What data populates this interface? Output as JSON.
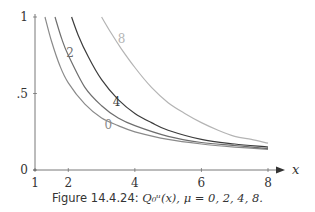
{
  "chart_data": {
    "type": "line",
    "title": "",
    "xlabel": "x",
    "ylabel": "",
    "xlim": [
      1,
      8.3
    ],
    "ylim": [
      0,
      1
    ],
    "grid": false,
    "legend": "inline curve labels",
    "x_ticks": [
      1,
      2,
      4,
      6,
      8
    ],
    "x_tick_labels": [
      "1",
      "2",
      "4",
      "6",
      "8"
    ],
    "y_ticks": [
      0,
      0.5,
      1
    ],
    "y_tick_labels": [
      "0",
      ".5",
      "1"
    ],
    "series": [
      {
        "name": "0",
        "color": "#8a8a8a",
        "label_pos": [
          3.2,
          0.27
        ],
        "points": [
          [
            1.3,
            1.0
          ],
          [
            1.5,
            0.84
          ],
          [
            1.75,
            0.68
          ],
          [
            2.0,
            0.57
          ],
          [
            2.5,
            0.43
          ],
          [
            3.0,
            0.34
          ],
          [
            3.5,
            0.29
          ],
          [
            4.0,
            0.25
          ],
          [
            5.0,
            0.2
          ],
          [
            6.0,
            0.17
          ],
          [
            7.0,
            0.15
          ],
          [
            8.0,
            0.135
          ]
        ]
      },
      {
        "name": "2",
        "color": "#6e6e6e",
        "label_pos": [
          2.05,
          0.74
        ],
        "points": [
          [
            1.6,
            1.0
          ],
          [
            1.8,
            0.86
          ],
          [
            2.0,
            0.75
          ],
          [
            2.5,
            0.54
          ],
          [
            3.0,
            0.42
          ],
          [
            3.5,
            0.34
          ],
          [
            4.0,
            0.29
          ],
          [
            5.0,
            0.22
          ],
          [
            6.0,
            0.18
          ],
          [
            7.0,
            0.16
          ],
          [
            8.0,
            0.14
          ]
        ]
      },
      {
        "name": "4",
        "color": "#3c3c3c",
        "label_pos": [
          3.45,
          0.42
        ],
        "points": [
          [
            2.1,
            1.0
          ],
          [
            2.3,
            0.88
          ],
          [
            2.6,
            0.74
          ],
          [
            3.0,
            0.59
          ],
          [
            3.5,
            0.46
          ],
          [
            4.0,
            0.37
          ],
          [
            4.5,
            0.31
          ],
          [
            5.0,
            0.26
          ],
          [
            6.0,
            0.2
          ],
          [
            7.0,
            0.17
          ],
          [
            8.0,
            0.15
          ]
        ]
      },
      {
        "name": "8",
        "color": "#b4b4b4",
        "label_pos": [
          3.6,
          0.83
        ],
        "points": [
          [
            3.0,
            1.0
          ],
          [
            3.3,
            0.89
          ],
          [
            3.6,
            0.79
          ],
          [
            4.0,
            0.67
          ],
          [
            4.5,
            0.54
          ],
          [
            5.0,
            0.44
          ],
          [
            5.5,
            0.37
          ],
          [
            6.0,
            0.31
          ],
          [
            6.5,
            0.26
          ],
          [
            7.0,
            0.22
          ],
          [
            7.5,
            0.2
          ],
          [
            8.0,
            0.175
          ]
        ]
      }
    ],
    "caption": {
      "prefix": "Figure 14.4.24:",
      "math": "Q0μ(x), μ = 0, 2, 4, 8."
    }
  },
  "caption": {
    "prefix": "Figure 14.4.24:",
    "math": "Q₀ᵘ(x), μ = 0, 2, 4, 8."
  }
}
